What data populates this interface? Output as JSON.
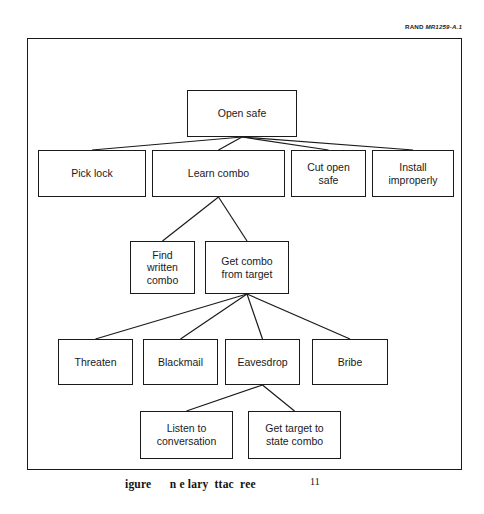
{
  "page": {
    "background_color": "#ffffff",
    "ink_color": "#1a1a1a"
  },
  "source_credit": {
    "brand": "RAND",
    "document_id": "MR1259-A.1"
  },
  "figure": {
    "frame": {
      "border_color": "#1a1a1a"
    },
    "caption": {
      "text": "igure      n e lary  ttac  ree",
      "page_number": "11"
    }
  },
  "chart_data": {
    "type": "diagram",
    "diagram_type": "attack-tree",
    "title": "igure      n e lary  ttac  ree",
    "root": "open-safe",
    "nodes": [
      {
        "id": "open-safe",
        "label": "Open safe",
        "level": 0,
        "x": 160,
        "y": 52,
        "w": 110,
        "h": 47
      },
      {
        "id": "pick-lock",
        "label": "Pick lock",
        "level": 1,
        "x": 11,
        "y": 112,
        "w": 108,
        "h": 47
      },
      {
        "id": "learn-combo",
        "label": "Learn combo",
        "level": 1,
        "x": 125,
        "y": 112,
        "w": 133,
        "h": 47
      },
      {
        "id": "cut-open-safe",
        "label": "Cut open\nsafe",
        "level": 1,
        "x": 264,
        "y": 112,
        "w": 75,
        "h": 47
      },
      {
        "id": "install-improperly",
        "label": "Install\nimproperly",
        "level": 1,
        "x": 345,
        "y": 112,
        "w": 82,
        "h": 47
      },
      {
        "id": "find-written-combo",
        "label": "Find\nwritten\ncombo",
        "level": 2,
        "x": 103,
        "y": 203,
        "w": 65,
        "h": 53
      },
      {
        "id": "get-combo-target",
        "label": "Get combo\nfrom target",
        "level": 2,
        "x": 178,
        "y": 203,
        "w": 84,
        "h": 53
      },
      {
        "id": "threaten",
        "label": "Threaten",
        "level": 3,
        "x": 31,
        "y": 301,
        "w": 75,
        "h": 46
      },
      {
        "id": "blackmail",
        "label": "Blackmail",
        "level": 3,
        "x": 116,
        "y": 301,
        "w": 75,
        "h": 46
      },
      {
        "id": "eavesdrop",
        "label": "Eavesdrop",
        "level": 3,
        "x": 198,
        "y": 301,
        "w": 75,
        "h": 46
      },
      {
        "id": "bribe",
        "label": "Bribe",
        "level": 3,
        "x": 285,
        "y": 301,
        "w": 76,
        "h": 46
      },
      {
        "id": "listen-conversation",
        "label": "Listen to\nconversation",
        "level": 4,
        "x": 113,
        "y": 373,
        "w": 93,
        "h": 48
      },
      {
        "id": "get-target-state",
        "label": "Get target to\nstate combo",
        "level": 4,
        "x": 221,
        "y": 373,
        "w": 93,
        "h": 48
      }
    ],
    "edges": [
      {
        "from": "open-safe",
        "to": "pick-lock"
      },
      {
        "from": "open-safe",
        "to": "learn-combo"
      },
      {
        "from": "open-safe",
        "to": "cut-open-safe"
      },
      {
        "from": "open-safe",
        "to": "install-improperly"
      },
      {
        "from": "learn-combo",
        "to": "find-written-combo"
      },
      {
        "from": "learn-combo",
        "to": "get-combo-target"
      },
      {
        "from": "get-combo-target",
        "to": "threaten"
      },
      {
        "from": "get-combo-target",
        "to": "blackmail"
      },
      {
        "from": "get-combo-target",
        "to": "eavesdrop"
      },
      {
        "from": "get-combo-target",
        "to": "bribe"
      },
      {
        "from": "eavesdrop",
        "to": "listen-conversation"
      },
      {
        "from": "eavesdrop",
        "to": "get-target-state"
      }
    ]
  }
}
